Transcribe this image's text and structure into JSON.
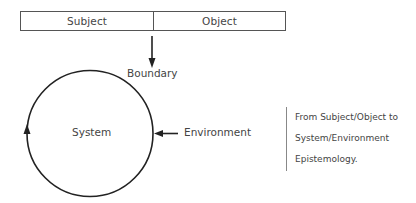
{
  "diagram": {
    "top_box": {
      "left_label": "Subject",
      "right_label": "Object"
    },
    "boundary_label": "Boundary",
    "system_label": "System",
    "environment_label": "Environment",
    "note": {
      "lines": [
        "From Subject/Object to",
        "System/Environment",
        "Epistemology."
      ]
    },
    "colors": {
      "stroke": "#222222",
      "text": "#444444",
      "box_border": "#555555",
      "note_rule": "#888888"
    }
  }
}
